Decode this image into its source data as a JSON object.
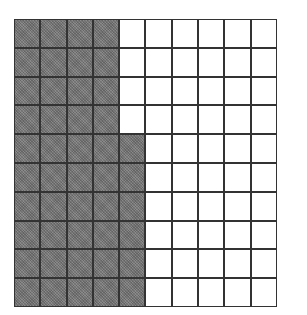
{
  "diagram": {
    "type": "hundred-grid",
    "rows": 10,
    "columns": 10,
    "shaded_count": 46,
    "total_count": 100,
    "shaded_columns_full": 4,
    "partial_column": {
      "index": 5,
      "shaded_rows_from_bottom": 6
    },
    "colors": {
      "shaded": "#7a7a7a",
      "unshaded": "#ffffff",
      "lines": "#333333"
    }
  }
}
